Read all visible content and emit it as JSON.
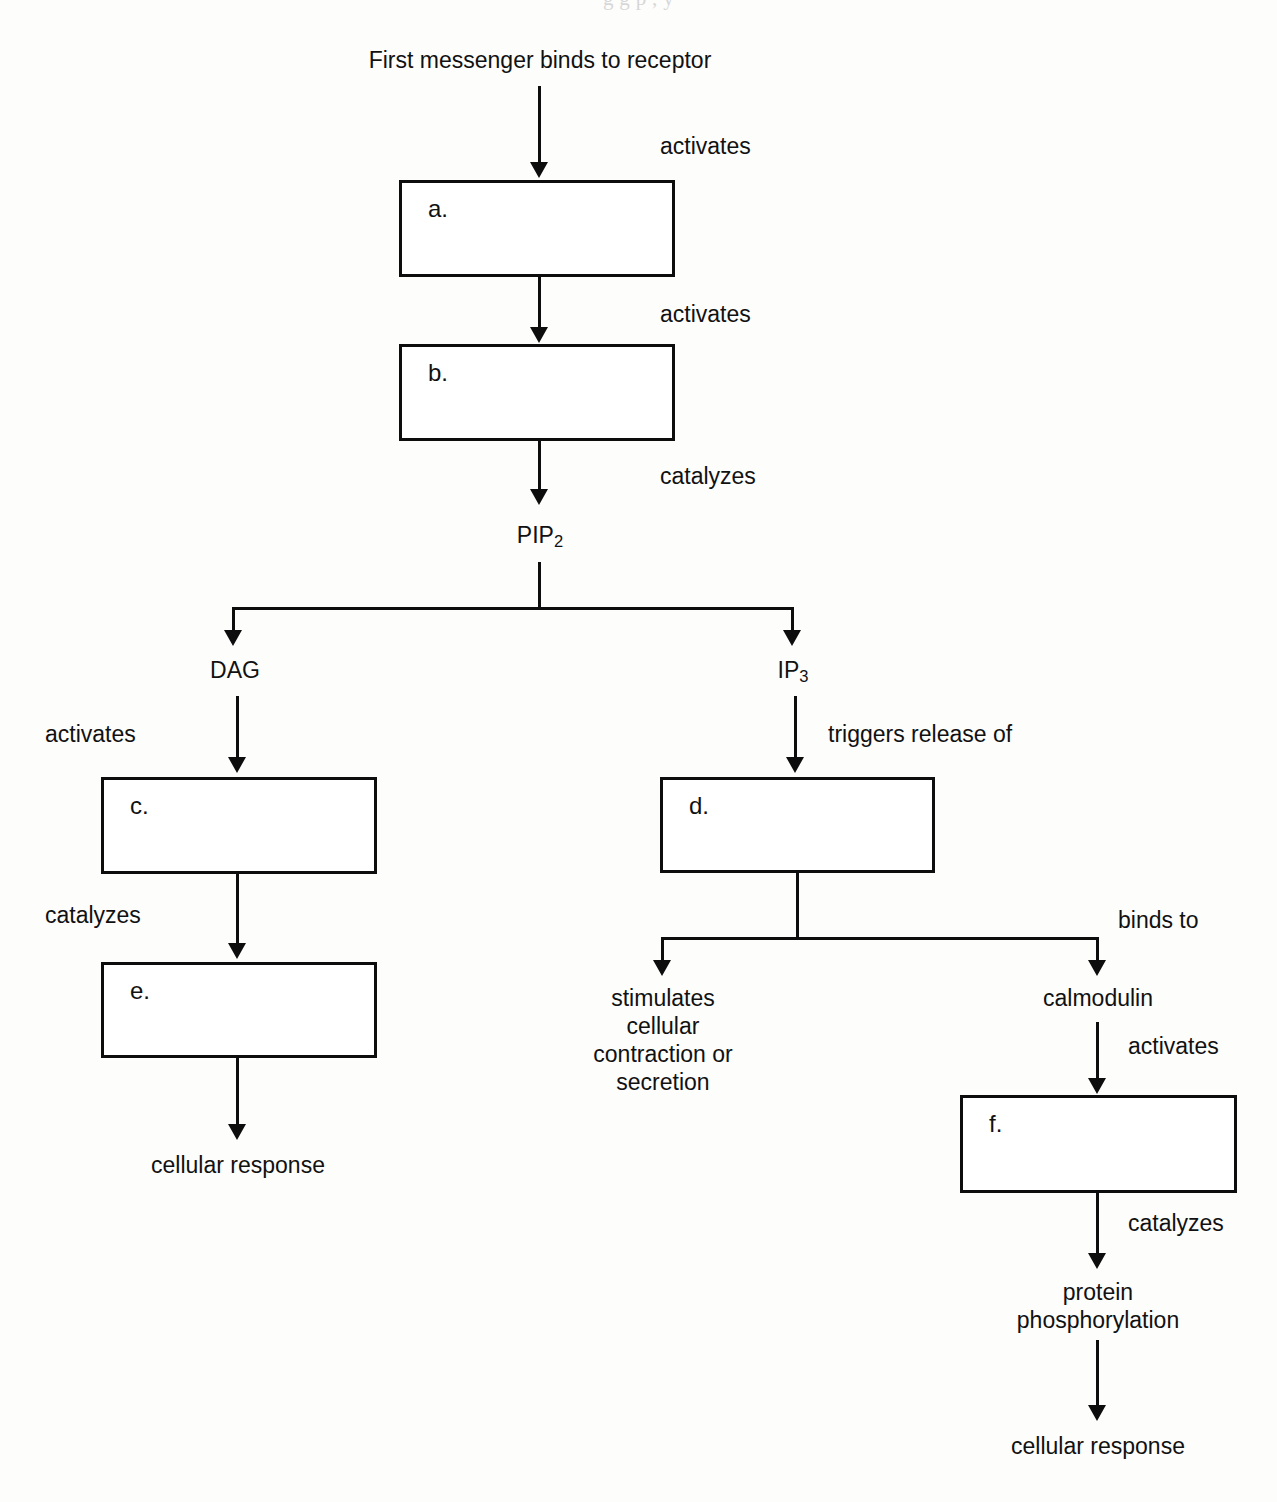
{
  "page": {
    "ghost_text": "g g    p  , y"
  },
  "nodes": {
    "first_messenger": "First messenger binds to receptor",
    "pip2": "PIP",
    "pip2_sub": "2",
    "dag": "DAG",
    "ip3": "IP",
    "ip3_sub": "3",
    "stimulates_block": "stimulates\ncellular\ncontraction or\nsecretion",
    "stimulates_line1": "stimulates",
    "stimulates_line2": "cellular",
    "stimulates_line3": "contraction or",
    "stimulates_line4": "secretion",
    "calmodulin": "calmodulin",
    "protein_phos_line1": "protein",
    "protein_phos_line2": "phosphorylation",
    "cellular_response_left": "cellular response",
    "cellular_response_right": "cellular response"
  },
  "boxes": [
    {
      "id": "a",
      "label": "a."
    },
    {
      "id": "b",
      "label": "b."
    },
    {
      "id": "c",
      "label": "c."
    },
    {
      "id": "d",
      "label": "d."
    },
    {
      "id": "e",
      "label": "e."
    },
    {
      "id": "f",
      "label": "f."
    }
  ],
  "edge_labels": {
    "activates_1": "activates",
    "activates_2": "activates",
    "catalyzes_1": "catalyzes",
    "activates_dag": "activates",
    "catalyzes_left": "catalyzes",
    "triggers_release": "triggers release of",
    "binds_to": "binds to",
    "activates_calmodulin": "activates",
    "catalyzes_right": "catalyzes"
  },
  "colors": {
    "ink": "#0d0d0d",
    "text": "#111111",
    "background": "#fdfdfc",
    "box_fill": "#ffffff"
  }
}
